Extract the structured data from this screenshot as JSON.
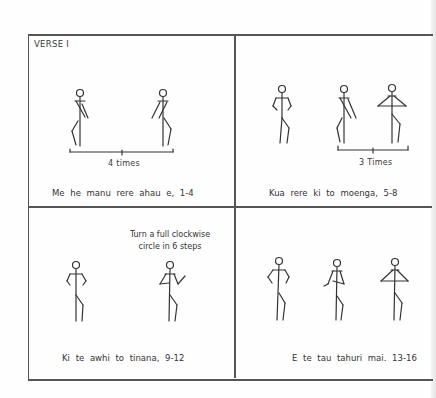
{
  "verse_label": "VERSE I",
  "panels": [
    {
      "caption": "Me he manu rere ahau e, 1-4",
      "repeat_label": "4 times"
    },
    {
      "caption": "Kua rere ki to moenga, 5-8",
      "repeat_label": "3 Times"
    },
    {
      "caption": "Ki te awhi to tinana, 9-12",
      "note_line1": "Turn a full clockwise",
      "note_line2": "circle in 6 steps"
    },
    {
      "caption": "E te tau tahuri mai. 13-16"
    }
  ]
}
